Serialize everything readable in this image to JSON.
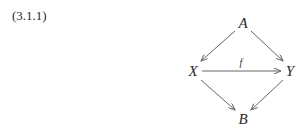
{
  "equation_number": "(3.1.1)",
  "diagram": {
    "nodes": {
      "A": {
        "label": "A",
        "x": 243,
        "y": 28
      },
      "X": {
        "label": "X",
        "x": 193,
        "y": 76
      },
      "Y": {
        "label": "Y",
        "x": 290,
        "y": 76
      },
      "B": {
        "label": "B",
        "x": 243,
        "y": 124
      }
    },
    "edges": [
      {
        "from": "A",
        "to": "X",
        "label": ""
      },
      {
        "from": "A",
        "to": "Y",
        "label": ""
      },
      {
        "from": "X",
        "to": "Y",
        "label": "f"
      },
      {
        "from": "X",
        "to": "B",
        "label": ""
      },
      {
        "from": "Y",
        "to": "B",
        "label": ""
      }
    ],
    "f_label": "f"
  }
}
